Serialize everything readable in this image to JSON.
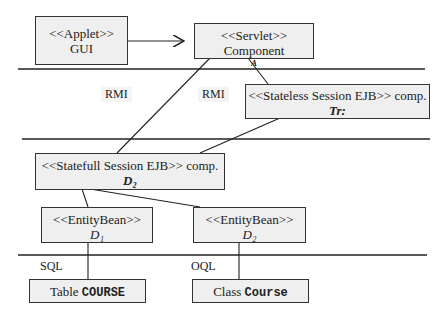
{
  "diagram": {
    "boxes": {
      "applet": {
        "stereotype": "<<Applet>>",
        "name": "GUI"
      },
      "servlet": {
        "title": "<<Servlet>> Component",
        "sub": "A"
      },
      "stateless": {
        "title": "<<Stateless Session EJB>> comp.",
        "sub": "Tr:"
      },
      "stateful": {
        "title": "<<Statefull Session EJB>> comp.",
        "sub": "D₂"
      },
      "entity1": {
        "stereotype": "<<EntityBean>>",
        "sub": "D₁"
      },
      "entity2": {
        "stereotype": "<<EntityBean>>",
        "sub": "D₂"
      },
      "table": {
        "prefix": "Table",
        "name": "COURSE"
      },
      "class": {
        "prefix": "Class",
        "name": "Course"
      }
    },
    "labels": {
      "rmi1": "RMI",
      "rmi2": "RMI",
      "sql": "SQL",
      "oql": "OQL"
    }
  }
}
